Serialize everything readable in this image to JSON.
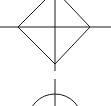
{
  "diagram": {
    "background": "#ffffff",
    "stroke_color": "#1a1a1a",
    "stroke_width": 1,
    "shapes": {
      "diamond": {
        "left": [
          18,
          27
        ],
        "right": [
          90,
          27
        ],
        "bottom": [
          55,
          64
        ],
        "top": [
          55,
          -10
        ]
      },
      "horizontal_axis": {
        "y": 27,
        "x1": 0,
        "x2": 111
      },
      "vertical_axis_upper": {
        "x": 55,
        "y1": 0,
        "y2": 71
      },
      "vertical_axis_gap": {
        "y1": 71,
        "y2": 79
      },
      "vertical_axis_lower": {
        "x": 55,
        "y1": 79,
        "y2": 106
      },
      "circle": {
        "cx": 55,
        "cy": 121,
        "r": 27
      }
    }
  }
}
